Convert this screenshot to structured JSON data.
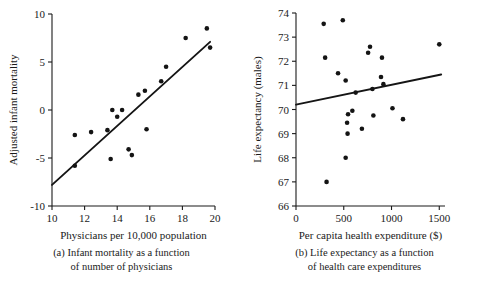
{
  "figure": {
    "name": "two-panel-scatterplot-figure",
    "background_color": "#ffffff",
    "ink_color": "#1a1a1a"
  },
  "chart_data": [
    {
      "id": "panel-a",
      "type": "scatter",
      "title": "",
      "caption_line1": "(a) Infant mortality as a function",
      "caption_line2": "of number of physicians",
      "xlabel": "Physicians per 10,000 population",
      "ylabel": "Adjusted infant mortality",
      "xlim": [
        10,
        20
      ],
      "ylim": [
        -10,
        10
      ],
      "xticks": [
        10,
        12,
        14,
        16,
        18,
        20
      ],
      "xtick_labels": [
        "10",
        "12",
        "14",
        "16",
        "18",
        "20"
      ],
      "yticks": [
        -10,
        -5,
        0,
        5,
        10
      ],
      "ytick_labels": [
        "-10",
        "-5",
        "0",
        "5",
        "10"
      ],
      "grid": false,
      "legend": "none",
      "points": [
        {
          "x": 11.4,
          "y": -2.6
        },
        {
          "x": 11.4,
          "y": -5.8
        },
        {
          "x": 12.4,
          "y": -2.3
        },
        {
          "x": 13.4,
          "y": -2.1
        },
        {
          "x": 13.6,
          "y": -5.1
        },
        {
          "x": 13.7,
          "y": 0.0
        },
        {
          "x": 14.0,
          "y": -0.7
        },
        {
          "x": 14.3,
          "y": 0.0
        },
        {
          "x": 14.7,
          "y": -4.1
        },
        {
          "x": 14.9,
          "y": -4.7
        },
        {
          "x": 15.3,
          "y": 1.6
        },
        {
          "x": 15.7,
          "y": 2.0
        },
        {
          "x": 15.8,
          "y": -2.0
        },
        {
          "x": 16.7,
          "y": 3.0
        },
        {
          "x": 17.0,
          "y": 4.5
        },
        {
          "x": 18.2,
          "y": 7.5
        },
        {
          "x": 19.5,
          "y": 8.5
        },
        {
          "x": 19.7,
          "y": 6.5
        }
      ],
      "fit_line": {
        "name": "least-squares-regression-line",
        "x_start": 10.0,
        "y_start": -7.8,
        "x_end": 19.7,
        "y_end": 7.1
      }
    },
    {
      "id": "panel-b",
      "type": "scatter",
      "title": "",
      "caption_line1": "(b) Life expectancy as a function",
      "caption_line2": "of health care expenditures",
      "xlabel": "Per capita health expenditure ($)",
      "ylabel": "Life expectancy (males)",
      "xlim": [
        0,
        1560
      ],
      "ylim": [
        66,
        74
      ],
      "xticks": [
        0,
        500,
        1000,
        1500
      ],
      "xtick_labels": [
        "0",
        "500",
        "1000",
        "1500"
      ],
      "yticks": [
        66,
        67,
        68,
        69,
        70,
        71,
        72,
        73,
        74
      ],
      "ytick_labels": [
        "66",
        "67",
        "68",
        "69",
        "70",
        "71",
        "72",
        "73",
        "74"
      ],
      "grid": false,
      "legend": "none",
      "points": [
        {
          "x": 290,
          "y": 73.55
        },
        {
          "x": 305,
          "y": 72.15
        },
        {
          "x": 320,
          "y": 67.0
        },
        {
          "x": 440,
          "y": 71.5
        },
        {
          "x": 490,
          "y": 73.7
        },
        {
          "x": 520,
          "y": 71.2
        },
        {
          "x": 520,
          "y": 68.0
        },
        {
          "x": 535,
          "y": 69.45
        },
        {
          "x": 540,
          "y": 69.0
        },
        {
          "x": 545,
          "y": 69.8
        },
        {
          "x": 590,
          "y": 69.95
        },
        {
          "x": 625,
          "y": 70.7
        },
        {
          "x": 690,
          "y": 69.2
        },
        {
          "x": 755,
          "y": 72.35
        },
        {
          "x": 775,
          "y": 72.6
        },
        {
          "x": 800,
          "y": 70.85
        },
        {
          "x": 810,
          "y": 69.75
        },
        {
          "x": 890,
          "y": 71.35
        },
        {
          "x": 900,
          "y": 72.15
        },
        {
          "x": 915,
          "y": 71.05
        },
        {
          "x": 1010,
          "y": 70.05
        },
        {
          "x": 1120,
          "y": 69.6
        },
        {
          "x": 1500,
          "y": 72.7
        }
      ],
      "fit_line": {
        "name": "least-squares-regression-line",
        "x_start": 0,
        "y_start": 70.2,
        "x_end": 1520,
        "y_end": 71.45
      }
    }
  ]
}
